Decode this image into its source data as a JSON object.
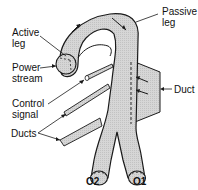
{
  "diagram": {
    "labels": {
      "active_leg_line1": "Active",
      "active_leg_line2": "leg",
      "passive_leg_line1": "Passive",
      "passive_leg_line2": "leg",
      "power_stream_line1": "Power",
      "power_stream_line2": "stream",
      "control_signal_line1": "Control",
      "control_signal_line2": "signal",
      "ducts": "Ducts",
      "duct": "Duct",
      "output_2": "O2",
      "output_1": "O1"
    },
    "colors": {
      "fill": "#d4d4d4",
      "stroke": "#1a1a1a",
      "background": "#ffffff"
    }
  }
}
